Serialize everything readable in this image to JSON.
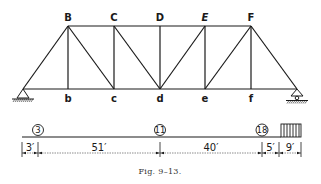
{
  "figure": {
    "caption": "Fig. 9–13.",
    "truss": {
      "top_nodes": [
        {
          "label": "B",
          "x": 68
        },
        {
          "label": "C",
          "x": 114
        },
        {
          "label": "D",
          "x": 160
        },
        {
          "label": "E",
          "x": 205
        },
        {
          "label": "F",
          "x": 251
        }
      ],
      "bottom_nodes": [
        {
          "label": "b",
          "x": 68
        },
        {
          "label": "c",
          "x": 114
        },
        {
          "label": "d",
          "x": 160
        },
        {
          "label": "e",
          "x": 205
        },
        {
          "label": "f",
          "x": 251
        }
      ],
      "supports": {
        "left": "pin-support",
        "right": "roller-support"
      }
    },
    "load_diagram": {
      "concentrated_loads": [
        {
          "value": "3",
          "x": 30
        },
        {
          "value": "11",
          "x": 160
        },
        {
          "value": "18",
          "x": 262
        }
      ],
      "uniform_load": {
        "label": "uniform-load"
      },
      "dimensions": [
        "3′",
        "51′",
        "40′",
        "5′",
        "9′"
      ]
    }
  },
  "colors": {
    "ink": "#1a1a1a",
    "background": "#ffffff"
  }
}
